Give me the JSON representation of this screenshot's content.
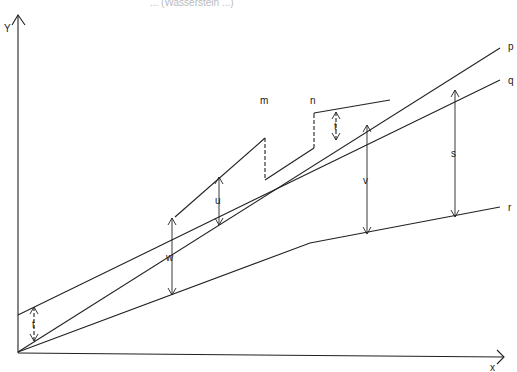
{
  "caption": "... (Wasserstein ...)",
  "axes": {
    "y_label": "Y",
    "x_label": "x"
  },
  "lines": {
    "p": "p",
    "q": "q",
    "r": "r"
  },
  "points": {
    "m": "m",
    "n": "n"
  },
  "distances": {
    "t_left": "t",
    "t_right": "t",
    "u": "u",
    "w": "w",
    "v": "v",
    "s": "s"
  }
}
